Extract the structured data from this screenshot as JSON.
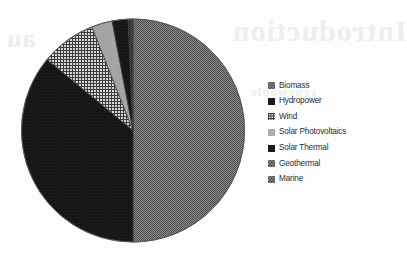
{
  "figure": {
    "background_color": "#fdfdfd",
    "show_through_text": [
      "Introduction",
      "au",
      "renewable",
      "energy sources"
    ]
  },
  "chart_data": {
    "type": "pie",
    "title": "",
    "subtitle": "",
    "xlabel": "",
    "ylabel": "",
    "grid": false,
    "legend_position": "right",
    "start_angle_deg": 0,
    "direction": "clockwise",
    "categories": [
      "Biomass",
      "Hydropower",
      "Wind",
      "Solar Photovoltaics",
      "Solar Thermal",
      "Geothermal",
      "Marine"
    ],
    "values": [
      50.0,
      36.0,
      8.0,
      3.0,
      2.3,
      0.5,
      0.2
    ],
    "units": "percent",
    "slices": [
      {
        "label": "Biomass",
        "value": 50.0,
        "fill": "#6e6e6e",
        "pattern": "fine-dither",
        "start_deg": 0.0,
        "end_deg": 180.0
      },
      {
        "label": "Hydropower",
        "value": 36.0,
        "fill": "#141414",
        "pattern": "solid",
        "start_deg": 180.0,
        "end_deg": 309.6
      },
      {
        "label": "Wind",
        "value": 8.0,
        "fill": "#5f5f5f",
        "pattern": "cross-hatch",
        "start_deg": 309.6,
        "end_deg": 338.4
      },
      {
        "label": "Solar Photovoltaics",
        "value": 3.0,
        "fill": "#a5a5a5",
        "pattern": "light-solid",
        "start_deg": 338.4,
        "end_deg": 349.2
      },
      {
        "label": "Solar Thermal",
        "value": 2.3,
        "fill": "#1c1c1c",
        "pattern": "solid",
        "start_deg": 349.2,
        "end_deg": 357.5
      },
      {
        "label": "Geothermal",
        "value": 0.5,
        "fill": "#4a4a4a",
        "pattern": "dither",
        "start_deg": 357.5,
        "end_deg": 359.3
      },
      {
        "label": "Marine",
        "value": 0.2,
        "fill": "#2a2a2a",
        "pattern": "dither",
        "start_deg": 359.3,
        "end_deg": 360.0
      }
    ]
  },
  "legend": {
    "items": [
      {
        "label": "Biomass",
        "swatch": "checker-gray"
      },
      {
        "label": "Hydropower",
        "swatch": "solid-dark"
      },
      {
        "label": "Wind",
        "swatch": "grid-hatch"
      },
      {
        "label": "Solar Photovoltaics",
        "swatch": "light-gray"
      },
      {
        "label": "Solar Thermal",
        "swatch": "solid-dark"
      },
      {
        "label": "Geothermal",
        "swatch": "checker-gray"
      },
      {
        "label": "Marine",
        "swatch": "checker-gray"
      }
    ]
  }
}
